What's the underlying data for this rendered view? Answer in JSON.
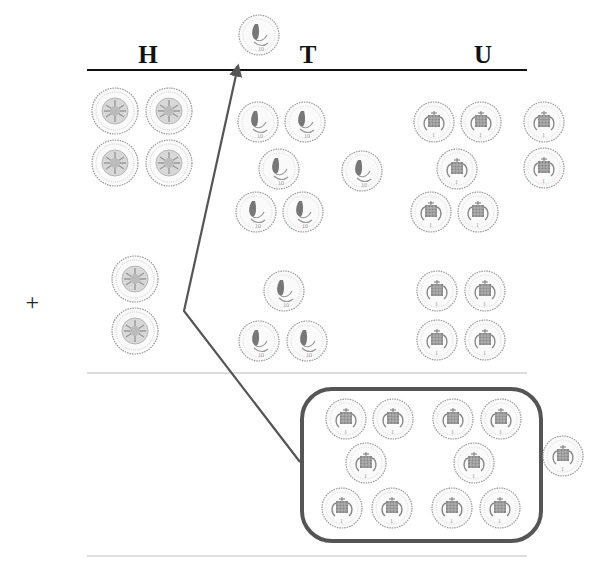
{
  "diagram": {
    "columns": [
      {
        "id": "H",
        "label": "H",
        "x": 148
      },
      {
        "id": "T",
        "label": "T",
        "x": 308
      },
      {
        "id": "U",
        "label": "U",
        "x": 483
      }
    ],
    "operator": {
      "symbol": "+",
      "x": 32,
      "y": 302
    },
    "coin_types": {
      "pound": {
        "name": "£1 coin",
        "icon": "pound-coin-icon",
        "radius": 23
      },
      "ten_pence": {
        "name": "10p coin",
        "icon": "ten-pence-coin-icon",
        "radius": 20
      },
      "one_penny": {
        "name": "1p coin",
        "icon": "one-penny-coin-icon",
        "radius": 20
      }
    },
    "rows": [
      {
        "name": "first-addend",
        "hundreds": [
          {
            "x": 115,
            "y": 111
          },
          {
            "x": 169,
            "y": 111
          },
          {
            "x": 115,
            "y": 163
          },
          {
            "x": 169,
            "y": 163
          }
        ],
        "tens": [
          {
            "x": 258,
            "y": 122
          },
          {
            "x": 305,
            "y": 122
          },
          {
            "x": 279,
            "y": 169
          },
          {
            "x": 362,
            "y": 171
          },
          {
            "x": 256,
            "y": 212
          },
          {
            "x": 303,
            "y": 212
          }
        ],
        "units": [
          {
            "x": 434,
            "y": 122
          },
          {
            "x": 481,
            "y": 122
          },
          {
            "x": 544,
            "y": 122
          },
          {
            "x": 457,
            "y": 169
          },
          {
            "x": 544,
            "y": 168
          },
          {
            "x": 431,
            "y": 212
          },
          {
            "x": 478,
            "y": 212
          }
        ]
      },
      {
        "name": "second-addend",
        "hundreds": [
          {
            "x": 135,
            "y": 279
          },
          {
            "x": 135,
            "y": 331
          }
        ],
        "tens": [
          {
            "x": 284,
            "y": 291
          },
          {
            "x": 259,
            "y": 341
          },
          {
            "x": 307,
            "y": 341
          }
        ],
        "units": [
          {
            "x": 437,
            "y": 291
          },
          {
            "x": 485,
            "y": 291
          },
          {
            "x": 437,
            "y": 340
          },
          {
            "x": 485,
            "y": 340
          }
        ]
      },
      {
        "name": "answer",
        "hundreds": [],
        "tens": [],
        "units_grouped": [
          {
            "x": 346,
            "y": 419
          },
          {
            "x": 393,
            "y": 419
          },
          {
            "x": 453,
            "y": 419
          },
          {
            "x": 501,
            "y": 419
          },
          {
            "x": 366,
            "y": 463
          },
          {
            "x": 474,
            "y": 463
          },
          {
            "x": 342,
            "y": 508
          },
          {
            "x": 392,
            "y": 508
          },
          {
            "x": 452,
            "y": 508
          },
          {
            "x": 500,
            "y": 508
          }
        ],
        "units_loose": [
          {
            "x": 563,
            "y": 456
          }
        ]
      }
    ],
    "carried_coin": {
      "type": "ten_pence",
      "x": 259,
      "y": 35
    },
    "group_box": {
      "x": 302,
      "y": 389,
      "width": 239,
      "height": 152,
      "radius": 30,
      "count": 10
    },
    "exchange_arrow": {
      "points": [
        [
          300,
          462
        ],
        [
          184,
          311
        ],
        [
          238,
          64
        ]
      ]
    },
    "rules": [
      {
        "name": "header-rule",
        "y": 70,
        "x1": 87,
        "x2": 527,
        "color": "#111111",
        "width": 2
      },
      {
        "name": "addend-rule",
        "y": 373,
        "x1": 87,
        "x2": 527,
        "color": "#bbbbbb",
        "width": 1
      },
      {
        "name": "answer-rule",
        "y": 556,
        "x1": 87,
        "x2": 527,
        "color": "#bbbbbb",
        "width": 1
      }
    ],
    "colors": {
      "ink": "#111111",
      "box": "#555555",
      "arrow": "#555555",
      "coin": "#888888",
      "rule_light": "#bbbbbb"
    }
  }
}
